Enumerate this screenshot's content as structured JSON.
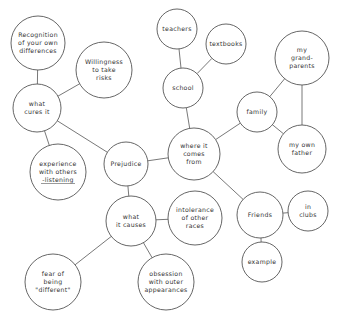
{
  "diagram": {
    "type": "concept-map",
    "central_topic": "Prejudice",
    "colors": {
      "line": "#555555",
      "text": "#333333",
      "background": "#ffffff"
    },
    "nodes": [
      {
        "id": "recognition",
        "lines": [
          "Recognition",
          "of your own",
          "differences"
        ],
        "cx": 38,
        "cy": 43,
        "r": 27
      },
      {
        "id": "willingness",
        "lines": [
          "Willingness",
          "to take",
          "risks"
        ],
        "cx": 104,
        "cy": 70,
        "r": 28
      },
      {
        "id": "what-cures-it",
        "lines": [
          "what",
          "cures it"
        ],
        "cx": 37,
        "cy": 108,
        "r": 24
      },
      {
        "id": "experience",
        "lines": [
          "experience",
          "with others",
          "-listening"
        ],
        "cx": 58,
        "cy": 172,
        "r": 28
      },
      {
        "id": "prejudice",
        "lines": [
          "Prejudice"
        ],
        "cx": 126,
        "cy": 164,
        "r": 22
      },
      {
        "id": "teachers",
        "lines": [
          "teachers"
        ],
        "cx": 177,
        "cy": 29,
        "r": 20
      },
      {
        "id": "textbooks",
        "lines": [
          "textbooks"
        ],
        "cx": 226,
        "cy": 44,
        "r": 20
      },
      {
        "id": "school",
        "lines": [
          "school"
        ],
        "cx": 183,
        "cy": 88,
        "r": 20
      },
      {
        "id": "where-it-comes-from",
        "lines": [
          "where it",
          "comes",
          "from"
        ],
        "cx": 194,
        "cy": 154,
        "r": 26
      },
      {
        "id": "family",
        "lines": [
          "family"
        ],
        "cx": 257,
        "cy": 112,
        "r": 20
      },
      {
        "id": "grandparents",
        "lines": [
          "my",
          "grand-",
          "parents"
        ],
        "cx": 302,
        "cy": 58,
        "r": 27
      },
      {
        "id": "father",
        "lines": [
          "my own",
          "father"
        ],
        "cx": 302,
        "cy": 149,
        "r": 24
      },
      {
        "id": "what-it-causes",
        "lines": [
          "what",
          "it causes"
        ],
        "cx": 131,
        "cy": 221,
        "r": 25
      },
      {
        "id": "intolerance",
        "lines": [
          "intolerance",
          "of other",
          "races"
        ],
        "cx": 195,
        "cy": 218,
        "r": 27
      },
      {
        "id": "friends",
        "lines": [
          "Friends"
        ],
        "cx": 260,
        "cy": 215,
        "r": 23
      },
      {
        "id": "in-clubs",
        "lines": [
          "in",
          "clubs"
        ],
        "cx": 308,
        "cy": 211,
        "r": 20
      },
      {
        "id": "example",
        "lines": [
          "example"
        ],
        "cx": 262,
        "cy": 262,
        "r": 20
      },
      {
        "id": "fear",
        "lines": [
          "fear of",
          "being",
          "\"different\""
        ],
        "cx": 53,
        "cy": 282,
        "r": 28
      },
      {
        "id": "obsession",
        "lines": [
          "obsession",
          "with outer",
          "appearances"
        ],
        "cx": 166,
        "cy": 282,
        "r": 28
      }
    ],
    "edges": [
      [
        "recognition",
        "what-cures-it"
      ],
      [
        "willingness",
        "what-cures-it"
      ],
      [
        "what-cures-it",
        "experience"
      ],
      [
        "what-cures-it",
        "prejudice"
      ],
      [
        "prejudice",
        "where-it-comes-from"
      ],
      [
        "prejudice",
        "what-it-causes"
      ],
      [
        "teachers",
        "school"
      ],
      [
        "textbooks",
        "school"
      ],
      [
        "school",
        "where-it-comes-from"
      ],
      [
        "where-it-comes-from",
        "family"
      ],
      [
        "where-it-comes-from",
        "friends"
      ],
      [
        "family",
        "grandparents"
      ],
      [
        "family",
        "father"
      ],
      [
        "grandparents",
        "father"
      ],
      [
        "friends",
        "in-clubs"
      ],
      [
        "friends",
        "example"
      ],
      [
        "what-it-causes",
        "intolerance"
      ],
      [
        "what-it-causes",
        "fear"
      ],
      [
        "what-it-causes",
        "obsession"
      ]
    ]
  }
}
